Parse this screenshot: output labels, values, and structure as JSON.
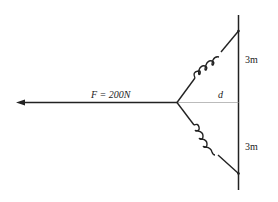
{
  "diagram": {
    "force_label": "F = 200N",
    "distance_label": "d",
    "top_spacing_label": "3m",
    "bottom_spacing_label": "3m",
    "colors": {
      "line": "#222222",
      "guide": "#aaaaaa",
      "background": "#ffffff"
    }
  }
}
